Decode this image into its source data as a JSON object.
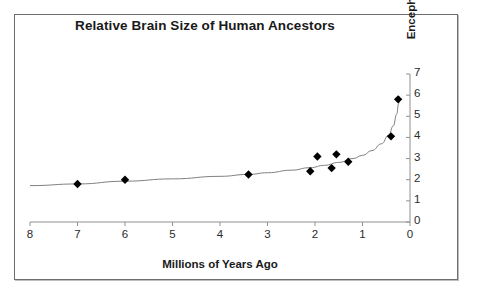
{
  "chart_data": {
    "type": "scatter",
    "title": "Relative Brain Size of Human Ancestors",
    "xlabel": "Millions of Years Ago",
    "ylabel": "Encephalization Quotiont",
    "xlim": [
      8,
      0
    ],
    "ylim": [
      0,
      7
    ],
    "x_ticks": [
      8,
      7,
      6,
      5,
      4,
      3,
      2,
      1,
      0
    ],
    "y_ticks": [
      0,
      1,
      2,
      3,
      4,
      5,
      6,
      7
    ],
    "x_axis_reversed": true,
    "grid": false,
    "legend": null,
    "y_axis_position": "right",
    "marker": "diamond",
    "marker_color": "#000000",
    "trendline_color": "#808080",
    "points": [
      {
        "x": 7.0,
        "y": 1.8
      },
      {
        "x": 6.0,
        "y": 2.0
      },
      {
        "x": 3.4,
        "y": 2.25
      },
      {
        "x": 2.1,
        "y": 2.4
      },
      {
        "x": 1.95,
        "y": 3.1
      },
      {
        "x": 1.65,
        "y": 2.55
      },
      {
        "x": 1.55,
        "y": 3.2
      },
      {
        "x": 1.3,
        "y": 2.85
      },
      {
        "x": 0.4,
        "y": 4.05
      },
      {
        "x": 0.25,
        "y": 5.8
      }
    ],
    "trendline": [
      {
        "x": 8.0,
        "y": 1.72
      },
      {
        "x": 7.0,
        "y": 1.8
      },
      {
        "x": 6.0,
        "y": 1.93
      },
      {
        "x": 5.0,
        "y": 2.04
      },
      {
        "x": 4.0,
        "y": 2.16
      },
      {
        "x": 3.4,
        "y": 2.25
      },
      {
        "x": 3.0,
        "y": 2.33
      },
      {
        "x": 2.5,
        "y": 2.45
      },
      {
        "x": 2.1,
        "y": 2.57
      },
      {
        "x": 1.8,
        "y": 2.68
      },
      {
        "x": 1.5,
        "y": 2.82
      },
      {
        "x": 1.2,
        "y": 3.0
      },
      {
        "x": 1.0,
        "y": 3.15
      },
      {
        "x": 0.8,
        "y": 3.38
      },
      {
        "x": 0.6,
        "y": 3.7
      },
      {
        "x": 0.45,
        "y": 4.1
      },
      {
        "x": 0.35,
        "y": 4.55
      },
      {
        "x": 0.28,
        "y": 5.1
      },
      {
        "x": 0.24,
        "y": 5.6
      },
      {
        "x": 0.22,
        "y": 5.95
      }
    ]
  },
  "axis_labels": {
    "x": [
      "8",
      "7",
      "6",
      "5",
      "4",
      "3",
      "2",
      "1",
      "0"
    ],
    "y": [
      "7",
      "6",
      "5",
      "4",
      "3",
      "2",
      "1",
      "0"
    ]
  }
}
